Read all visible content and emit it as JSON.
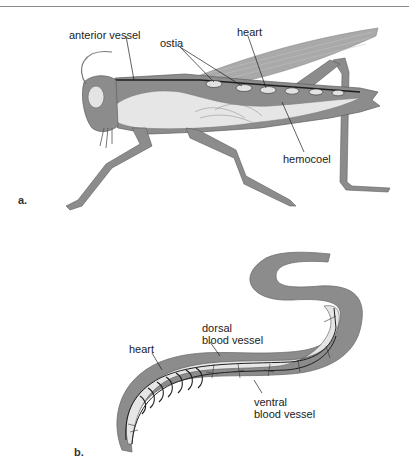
{
  "figure": {
    "panel_a": {
      "letter": "a.",
      "subject": "grasshopper open circulatory system",
      "labels": {
        "anterior_vessel": "anterior vessel",
        "ostia": "ostia",
        "heart": "heart",
        "hemocoel": "hemocoel"
      }
    },
    "panel_b": {
      "letter": "b.",
      "subject": "earthworm closed circulatory system",
      "labels": {
        "dorsal_vessel_line1": "dorsal",
        "dorsal_vessel_line2": "blood vessel",
        "heart": "heart",
        "ventral_vessel_line1": "ventral",
        "ventral_vessel_line2": "blood vessel"
      }
    },
    "colors": {
      "tissue": "#8c8c8c",
      "tissue_dark": "#6e6e6e",
      "wing": "#a9a9a9",
      "interior": "#e6e6e6",
      "line": "#1e1e1e"
    }
  }
}
